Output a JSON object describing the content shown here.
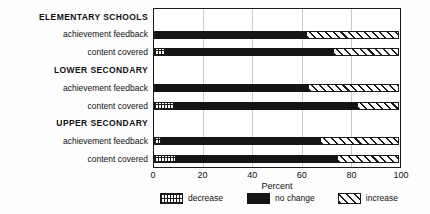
{
  "figure": {
    "background": "#fdfdfd",
    "frame_color": "#1a1a1a",
    "grid_color": "#c9c9c9",
    "bar_fill_color": "#141414"
  },
  "chart_data": {
    "type": "bar",
    "orientation": "horizontal",
    "stacked": true,
    "title": "",
    "xlabel": "Percent",
    "ylabel": "",
    "xlim": [
      0,
      100
    ],
    "xticks": [
      "0",
      "20",
      "40",
      "60",
      "80",
      "100"
    ],
    "grid": "vertical",
    "legend_position": "bottom",
    "series_order": [
      "decrease",
      "no change",
      "increase"
    ],
    "legend": [
      {
        "name": "decrease",
        "pattern": "crosshatch-grid",
        "color": "#1a1a1a"
      },
      {
        "name": "no change",
        "pattern": "solid",
        "color": "#141414"
      },
      {
        "name": "increase",
        "pattern": "diagonal-hatch",
        "color": "#1a1a1a"
      }
    ],
    "groups": [
      {
        "label": "ELEMENTARY SCHOOLS",
        "bars": [
          {
            "label": "achievement feedback",
            "values": {
              "decrease": 1,
              "no change": 61,
              "increase": 38
            }
          },
          {
            "label": "content covered",
            "values": {
              "decrease": 5,
              "no change": 68,
              "increase": 27
            }
          }
        ]
      },
      {
        "label": "LOWER SECONDARY",
        "bars": [
          {
            "label": "achievement feedback",
            "values": {
              "decrease": 1,
              "no change": 62,
              "increase": 37
            }
          },
          {
            "label": "content covered",
            "values": {
              "decrease": 8,
              "no change": 75,
              "increase": 17
            }
          }
        ]
      },
      {
        "label": "UPPER SECONDARY",
        "bars": [
          {
            "label": "achievement feedback",
            "values": {
              "decrease": 3,
              "no change": 65,
              "increase": 32
            }
          },
          {
            "label": "content covered",
            "values": {
              "decrease": 9,
              "no change": 66,
              "increase": 25
            }
          }
        ]
      }
    ]
  },
  "layout": {
    "plot": {
      "left": 153,
      "top": 8,
      "width": 248,
      "height": 160
    },
    "label_column_width": 148,
    "bar_height": 8,
    "tick_row_top": 171,
    "axis_title_top": 182,
    "legend_top": 193,
    "legend_left": 160,
    "legend_width": 238
  }
}
